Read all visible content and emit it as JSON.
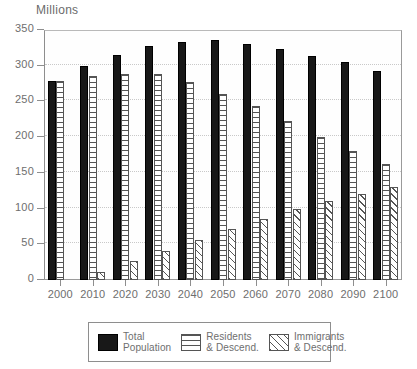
{
  "chart_data": {
    "type": "bar",
    "title": "Millions",
    "subtitle": "",
    "xlabel": "",
    "ylabel": "Millions",
    "ylim": [
      0,
      350
    ],
    "yticks": [
      0,
      50,
      100,
      150,
      200,
      250,
      300,
      350
    ],
    "ytick_labels": [
      "0",
      "50",
      "100",
      "150",
      "200",
      "250",
      "300",
      "350"
    ],
    "grid": true,
    "legend_position": "bottom",
    "categories": [
      "2000",
      "2010",
      "2020",
      "2030",
      "2040",
      "2050",
      "2060",
      "2070",
      "2080",
      "2090",
      "2100"
    ],
    "series": [
      {
        "name": "Total Population",
        "pattern": "solid-black",
        "values": [
          279,
          299,
          315,
          328,
          333,
          336,
          331,
          324,
          314,
          305,
          293
        ]
      },
      {
        "name": "Residents & Descend.",
        "pattern": "horizontal-lines",
        "values": [
          279,
          286,
          289,
          288,
          277,
          261,
          243,
          222,
          200,
          181,
          163
        ]
      },
      {
        "name": "Immigrants & Descend.",
        "pattern": "diagonal-lines",
        "values": [
          0,
          11,
          27,
          41,
          56,
          71,
          86,
          99,
          110,
          120,
          130
        ]
      }
    ]
  },
  "legend": {
    "items": [
      {
        "label_line1": "Total",
        "label_line2": "Population",
        "swatch": "solid-black-swatch"
      },
      {
        "label_line1": "Residents",
        "label_line2": "& Descend.",
        "swatch": "horizontal-lines-swatch"
      },
      {
        "label_line1": "Immigrants",
        "label_line2": "& Descend.",
        "swatch": "diagonal-lines-swatch"
      }
    ]
  },
  "colors": {
    "total": "#181818",
    "outline": "#555555",
    "axis": "#8e8e8e",
    "grid": "#c9c9c9",
    "text": "#6e6e6e",
    "background": "#ffffff"
  }
}
